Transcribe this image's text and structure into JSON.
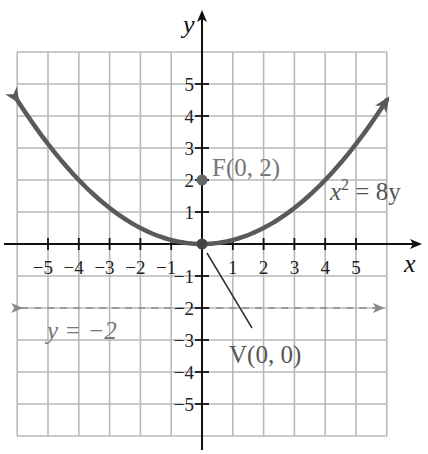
{
  "chart_data": {
    "type": "line",
    "title": "",
    "xlabel": "x",
    "ylabel": "y",
    "xlim": [
      -6,
      6
    ],
    "ylim": [
      -6,
      6
    ],
    "grid": true,
    "x_ticks": [
      -5,
      -4,
      -3,
      -2,
      -1,
      1,
      2,
      3,
      4,
      5
    ],
    "y_ticks": [
      -5,
      -4,
      -3,
      -2,
      -1,
      1,
      2,
      3,
      4,
      5
    ],
    "x_tick_labels": [
      "−5",
      "−4",
      "−3",
      "−2",
      "−1",
      "1",
      "2",
      "3",
      "4",
      "5"
    ],
    "y_tick_labels": [
      "−5",
      "−4",
      "−3",
      "−2",
      "−1",
      "1",
      "2",
      "3",
      "4",
      "5"
    ],
    "series": [
      {
        "name": "x^2 = 8y",
        "equation": "y = x^2 / 8",
        "x": [
          -6,
          -5,
          -4,
          -3,
          -2,
          -1,
          0,
          1,
          2,
          3,
          4,
          5,
          6
        ],
        "y": [
          4.5,
          3.125,
          2,
          1.125,
          0.5,
          0.125,
          0,
          0.125,
          0.5,
          1.125,
          2,
          3.125,
          4.5
        ],
        "arrows_at_ends": true,
        "color": "#5a5a5a"
      },
      {
        "name": "directrix",
        "equation": "y = -2",
        "x": [
          -6,
          6
        ],
        "y": [
          -2,
          -2
        ],
        "style": "dashed",
        "arrows_at_ends": true,
        "color": "#8a8a8a"
      }
    ],
    "points": [
      {
        "label": "F(0, 2)",
        "x": 0,
        "y": 2,
        "name": "focus"
      },
      {
        "label": "V(0, 0)",
        "x": 0,
        "y": 0,
        "name": "vertex"
      }
    ],
    "annotations": [
      {
        "text": "F(0, 2)",
        "x": 0.35,
        "y": 2.1
      },
      {
        "text": "x² = 8y",
        "x": 4.1,
        "y": 1.4
      },
      {
        "text": "y = −2",
        "x": -5.0,
        "y": -2.7
      },
      {
        "text": "V(0, 0)",
        "x": 0.9,
        "y": -3.7,
        "leader_line_to": [
          0,
          0
        ]
      }
    ]
  },
  "labels": {
    "x_axis": "x",
    "y_axis": "y",
    "focus": "F(0, 2)",
    "vertex": "V(0, 0)",
    "equation_base": "x",
    "equation_exp": "2",
    "equation_rest": " = 8y",
    "directrix": "y = −2"
  },
  "colors": {
    "grid": "#b8b8b8",
    "axis": "#111111",
    "curve": "#5a5a5a",
    "directrix": "#8a8a8a",
    "annotation": "#777777"
  }
}
